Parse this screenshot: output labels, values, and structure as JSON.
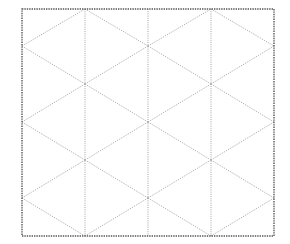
{
  "diagram": {
    "type": "isometric-triangle-grid",
    "width": 290,
    "height": 244,
    "frame": {
      "x1": 22,
      "y1": 9,
      "x2": 274,
      "y2": 236
    },
    "colors": {
      "frame": "#555555",
      "grid": "#9a9a9a",
      "background": "#ffffff"
    },
    "columns_x": [
      22,
      85,
      148,
      211,
      274
    ],
    "even_column_vertices_y": [
      46,
      122,
      198
    ],
    "odd_column_vertices_y": [
      9,
      84,
      160,
      236
    ],
    "vertical_lines_x": [
      85,
      148,
      211
    ]
  }
}
